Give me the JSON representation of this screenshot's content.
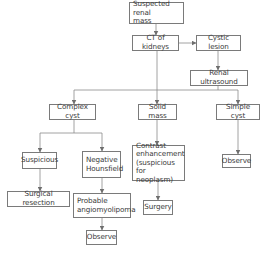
{
  "diagram": {
    "type": "flowchart",
    "colors": {
      "line": "#7a7a7a",
      "text": "#3a3a3a",
      "box_border": "#7a7a7a",
      "background": "#ffffff"
    },
    "nodes": {
      "suspected": "Suspected renal\nmass",
      "ct": "CT of kidneys",
      "cystic": "Cystic lesion",
      "ultrasound": "Renal ultrasound",
      "complex": "Complex cyst",
      "solid": "Solid mass",
      "simple": "Simple cyst",
      "suspicious": "Suspicious",
      "negative": "Negative\nHounsfield",
      "contrast": "Contrast\nenhancement\n(suspicious for\nneoplasm)",
      "observe_simple": "Observe",
      "surgical": "Surgical resection",
      "angiomyolipoma": "Probable\nangiomyolipoma",
      "surgery": "Surgery",
      "observe_aml": "Observe"
    },
    "edges": [
      [
        "Suspected renal mass",
        "CT of kidneys"
      ],
      [
        "CT of kidneys",
        "Cystic lesion"
      ],
      [
        "Cystic lesion",
        "Renal ultrasound"
      ],
      [
        "CT of kidneys",
        "Complex cyst"
      ],
      [
        "CT of kidneys",
        "Solid mass"
      ],
      [
        "Renal ultrasound",
        "Simple cyst"
      ],
      [
        "Complex cyst",
        "Suspicious"
      ],
      [
        "Complex cyst",
        "Negative Hounsfield"
      ],
      [
        "Solid mass",
        "Contrast enhancement (suspicious for neoplasm)"
      ],
      [
        "Simple cyst",
        "Observe"
      ],
      [
        "Suspicious",
        "Surgical resection"
      ],
      [
        "Negative Hounsfield",
        "Probable angiomyolipoma"
      ],
      [
        "Contrast enhancement (suspicious for neoplasm)",
        "Surgery"
      ],
      [
        "Probable angiomyolipoma",
        "Observe"
      ]
    ]
  }
}
